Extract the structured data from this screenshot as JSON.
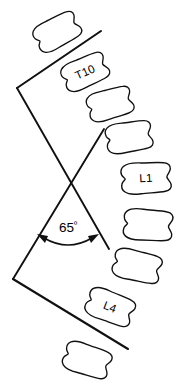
{
  "diagram": {
    "type": "lateral-spine-cobb-angle-tracing",
    "title": "",
    "background_color": "#ffffff",
    "line_color": "#111111",
    "angle": {
      "value": "65",
      "degree_symbol": "º",
      "full_label": "65º",
      "name": "cobb-angle"
    },
    "vertebrae": [
      {
        "id": "v1",
        "label": "",
        "name": "vertebra-t9",
        "cx": 57,
        "cy": 32,
        "w": 51,
        "h": 31,
        "rot": -28
      },
      {
        "id": "v2",
        "label": "T10",
        "name": "vertebra-t10",
        "cx": 85,
        "cy": 72,
        "w": 51,
        "h": 31,
        "rot": -24
      },
      {
        "id": "v3",
        "label": "",
        "name": "vertebra-t11",
        "cx": 110,
        "cy": 104,
        "w": 50,
        "h": 31,
        "rot": -16
      },
      {
        "id": "v4",
        "label": "",
        "name": "vertebra-t12",
        "cx": 129,
        "cy": 137,
        "w": 51,
        "h": 32,
        "rot": -9
      },
      {
        "id": "v5",
        "label": "L1",
        "name": "vertebra-l1",
        "cx": 146,
        "cy": 178,
        "w": 55,
        "h": 33,
        "rot": -3
      },
      {
        "id": "v6",
        "label": "",
        "name": "vertebra-l2",
        "cx": 148,
        "cy": 225,
        "w": 54,
        "h": 33,
        "rot": 4
      },
      {
        "id": "v7",
        "label": "",
        "name": "vertebra-l3",
        "cx": 137,
        "cy": 266,
        "w": 53,
        "h": 32,
        "rot": 13
      },
      {
        "id": "v8",
        "label": "L4",
        "name": "vertebra-l4",
        "cx": 110,
        "cy": 307,
        "w": 53,
        "h": 32,
        "rot": 21
      },
      {
        "id": "v9",
        "label": "",
        "name": "vertebra-l5",
        "cx": 87,
        "cy": 360,
        "w": 52,
        "h": 32,
        "rot": 18
      }
    ],
    "lines": {
      "upper_endplate": {
        "name": "upper-endplate-tangent-line",
        "x1": 17,
        "y1": 88,
        "x2": 101,
        "y2": 31
      },
      "lower_endplate": {
        "name": "lower-endplate-tangent-line",
        "x1": 13,
        "y1": 279,
        "x2": 128,
        "y2": 349
      },
      "upper_perpendicular": {
        "name": "upper-perpendicular-line",
        "x1": 13,
        "y1": 279,
        "x2": 104,
        "y2": 129
      },
      "lower_perpendicular": {
        "name": "lower-perpendicular-line",
        "x1": 17,
        "y1": 88,
        "x2": 109,
        "y2": 249
      }
    },
    "arc": {
      "name": "angle-measure-arc",
      "start_x": 39,
      "start_y": 236,
      "end_x": 97,
      "end_y": 236,
      "ctrl_x": 68,
      "ctrl_y": 252
    }
  }
}
